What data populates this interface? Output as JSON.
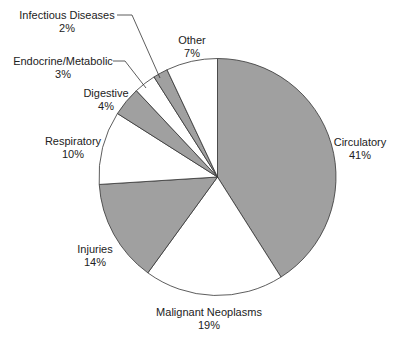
{
  "chart_data": {
    "type": "pie",
    "title": "",
    "start_angle": "12 o'clock, clockwise",
    "categories": [
      "Circulatory",
      "Malignant Neoplasms",
      "Injuries",
      "Respiratory",
      "Digestive",
      "Endocrine/Metabolic",
      "Infectious Diseases",
      "Other"
    ],
    "values": [
      41,
      19,
      14,
      10,
      4,
      3,
      2,
      7
    ],
    "unit": "%",
    "fills": [
      "#a0a0a0",
      "#ffffff",
      "#a0a0a0",
      "#ffffff",
      "#a0a0a0",
      "#ffffff",
      "#a0a0a0",
      "#ffffff"
    ],
    "legend": "none (direct labels)"
  },
  "labels": [
    {
      "name": "Circulatory",
      "pct": "41%"
    },
    {
      "name": "Malignant Neoplasms",
      "pct": "19%"
    },
    {
      "name": "Injuries",
      "pct": "14%"
    },
    {
      "name": "Respiratory",
      "pct": "10%"
    },
    {
      "name": "Digestive",
      "pct": "4%"
    },
    {
      "name": "Endocrine/Metabolic",
      "pct": "3%"
    },
    {
      "name": "Infectious Diseases",
      "pct": "2%"
    },
    {
      "name": "Other",
      "pct": "7%"
    }
  ]
}
